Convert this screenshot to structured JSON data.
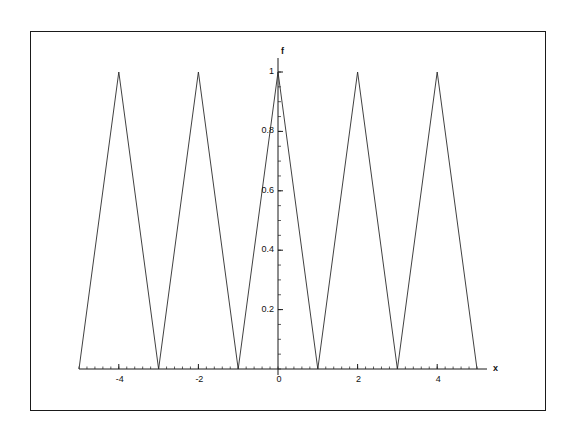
{
  "chart_data": {
    "type": "line",
    "title": "",
    "subtitle": "",
    "xlabel": "x",
    "ylabel": "f",
    "xlim": [
      -5,
      5
    ],
    "ylim": [
      0,
      1.0
    ],
    "grid": false,
    "legend": null,
    "x_ticks": [
      {
        "value": -4,
        "label": "-4"
      },
      {
        "value": -2,
        "label": "-2"
      },
      {
        "value": 0,
        "label": "0"
      },
      {
        "value": 2,
        "label": "2"
      },
      {
        "value": 4,
        "label": "4"
      }
    ],
    "y_ticks": [
      {
        "value": 0.2,
        "label": "0.2"
      },
      {
        "value": 0.4,
        "label": "0.4"
      },
      {
        "value": 0.6,
        "label": "0.6"
      },
      {
        "value": 0.8,
        "label": "0.8"
      },
      {
        "value": 1.0,
        "label": "1"
      }
    ],
    "x_minor_tick_step": 0.2,
    "y_minor_tick_step": 0.05,
    "series": [
      {
        "name": "f",
        "color": "#2b2b2b",
        "line_width": 0.9,
        "x": [
          -5,
          -4,
          -3,
          -2,
          -1,
          0,
          1,
          2,
          3,
          4,
          5
        ],
        "values": [
          0,
          1,
          0,
          1,
          0,
          1,
          0,
          1,
          0,
          1,
          0
        ]
      }
    ],
    "annotations": []
  },
  "axis_labels": {
    "x": "x",
    "f": "f"
  },
  "colors": {
    "line": "#2b2b2b",
    "axis": "#1a1a1a",
    "frame": "#1a1a1a",
    "background": "#ffffff",
    "text": "#111111"
  }
}
